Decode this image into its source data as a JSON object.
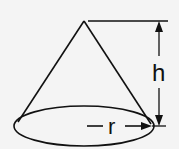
{
  "diagram": {
    "shape": "cone",
    "labels": {
      "height": "h",
      "radius": "r"
    },
    "colors": {
      "background": "#f4f4f4",
      "stroke": "#111111"
    }
  }
}
